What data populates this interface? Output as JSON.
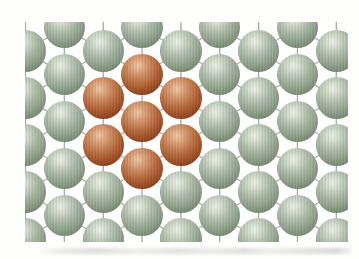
{
  "figure": {
    "background_color": "#fefefd",
    "frame": {
      "x": 25,
      "y": 22,
      "width": 323,
      "height": 220,
      "background_color": "#ffffff"
    },
    "lattice": {
      "col_origin_x": 0.5,
      "row_origin_y": 5.5,
      "col_spacing": 38.85,
      "row_spacing": 23.5,
      "cols": 9,
      "rows": 10,
      "occupancy_rule": "atom present where (col + row) is odd",
      "atom_radius": 20.7,
      "atom_count_total": 45,
      "atom_count_matrix": 38,
      "atom_count_impurity": 7
    },
    "bonds": {
      "color": "#a8acab",
      "width": 1.4,
      "connections": [
        "down-left diagonal",
        "down-right diagonal",
        "vertical two rows"
      ]
    },
    "atoms": {
      "matrix": {
        "label": "host lattice atom (sage green)",
        "gradient_stops": [
          "#eff2eb",
          "#d4ddcd",
          "#aebcaa",
          "#93a48f",
          "#76886f",
          "#5e7158",
          "#506351"
        ]
      },
      "impurity": {
        "label": "impurity atom (copper red)",
        "gradient_stops": [
          "#eccaa8",
          "#dda47d",
          "#c47a4d",
          "#ab592c",
          "#8c3b1a",
          "#6c2710",
          "#581d0c"
        ],
        "cells": [
          [
            3,
            2
          ],
          [
            2,
            3
          ],
          [
            4,
            3
          ],
          [
            3,
            4
          ],
          [
            2,
            5
          ],
          [
            4,
            5
          ],
          [
            3,
            6
          ]
        ]
      },
      "gradient_percents": [
        0,
        16,
        38,
        58,
        80,
        94,
        100
      ],
      "highlight_position": "40% 28%"
    },
    "smudge": {
      "x": 35,
      "y": 248,
      "width": 316,
      "height": 6,
      "color": "#9aa09a"
    }
  }
}
